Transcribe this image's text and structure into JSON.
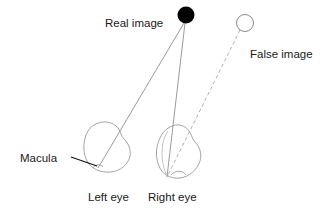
{
  "figure": {
    "background_color": "#ffffff",
    "width": 328,
    "height": 212
  },
  "colors": {
    "real_image_fill": "#000000",
    "false_image_fill": "#ffffff",
    "outline": "#8a8a8a",
    "eye_outline": "#9a9a9a",
    "ray_solid": "#8f8f8f",
    "ray_dashed": "#a8a8a8",
    "text": "#1a1a1a",
    "leader_line": "#111111"
  },
  "labels": {
    "real_image": "Real image",
    "false_image": "False image",
    "macula": "Macula",
    "left_eye": "Left eye",
    "right_eye": "Right eye"
  },
  "objects": {
    "real_image": {
      "name": "Real image",
      "shape": "filled-circle",
      "cx": 186,
      "cy": 15,
      "r": 8.5,
      "filled": true
    },
    "false_image": {
      "name": "False image",
      "shape": "hollow-circle",
      "cx": 245,
      "cy": 23,
      "r": 8.5,
      "filled": false
    }
  },
  "eyes": [
    {
      "id": "left-eye",
      "label": "Left eye",
      "cx": 107,
      "cy": 147,
      "rx": 23,
      "ry": 25,
      "macula_x": 98,
      "macula_y": 168
    },
    {
      "id": "right-eye",
      "label": "Right eye",
      "cx": 180,
      "cy": 151,
      "rx": 21,
      "ry": 26,
      "macula_x": 167,
      "macula_y": 176
    }
  ],
  "rays": [
    {
      "id": "real-to-left-eye",
      "style": "solid",
      "from": "real_image",
      "to": "left-eye-macula",
      "x1": 184,
      "y1": 23,
      "x2": 98,
      "y2": 168
    },
    {
      "id": "real-to-right-eye",
      "style": "solid",
      "from": "real_image",
      "to": "right-eye-macula",
      "x1": 185,
      "y1": 23,
      "x2": 167,
      "y2": 177
    },
    {
      "id": "false-to-right-eye",
      "style": "dashed",
      "from": "false_image",
      "to": "right-eye-macula",
      "x1": 240,
      "y1": 30,
      "x2": 167,
      "y2": 177
    }
  ],
  "leader": {
    "id": "macula-leader",
    "x1": 72,
    "y1": 158,
    "x2": 97,
    "y2": 166
  },
  "text_positions": {
    "real_image": {
      "x": 105,
      "y": 27,
      "anchor": "start"
    },
    "false_image": {
      "x": 250,
      "y": 58,
      "anchor": "start"
    },
    "macula": {
      "x": 20,
      "y": 162,
      "anchor": "start"
    },
    "left_eye": {
      "x": 88,
      "y": 200,
      "anchor": "start"
    },
    "right_eye": {
      "x": 148,
      "y": 200,
      "anchor": "start"
    }
  }
}
